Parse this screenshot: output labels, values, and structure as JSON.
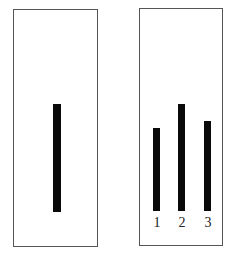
{
  "figure": {
    "standard_card": {
      "lines": [
        {
          "label": "",
          "relative_length": 108
        }
      ]
    },
    "comparison_card": {
      "lines": [
        {
          "label": "1",
          "relative_length": 83
        },
        {
          "label": "2",
          "relative_length": 107
        },
        {
          "label": "3",
          "relative_length": 90
        }
      ]
    },
    "colors": {
      "line": "#0a0a0a",
      "border": "#555555",
      "background": "#ffffff"
    }
  }
}
